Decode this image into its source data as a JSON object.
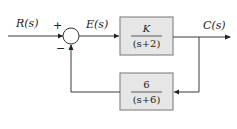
{
  "diagram": {
    "type": "feedback-control-block-diagram",
    "signals": {
      "input": "R(s)",
      "error": "E(s)",
      "output": "C(s)"
    },
    "summing_junction": {
      "plus_sign": "+",
      "minus_sign": "−"
    },
    "forward_block": {
      "numerator": "K",
      "denominator": "(s+2)"
    },
    "feedback_block": {
      "numerator": "6",
      "denominator": "(s+6)"
    },
    "colors": {
      "block_fill": "#e6e6e6",
      "block_stroke": "#8a8a8a",
      "wire": "#3a3a3a"
    }
  }
}
